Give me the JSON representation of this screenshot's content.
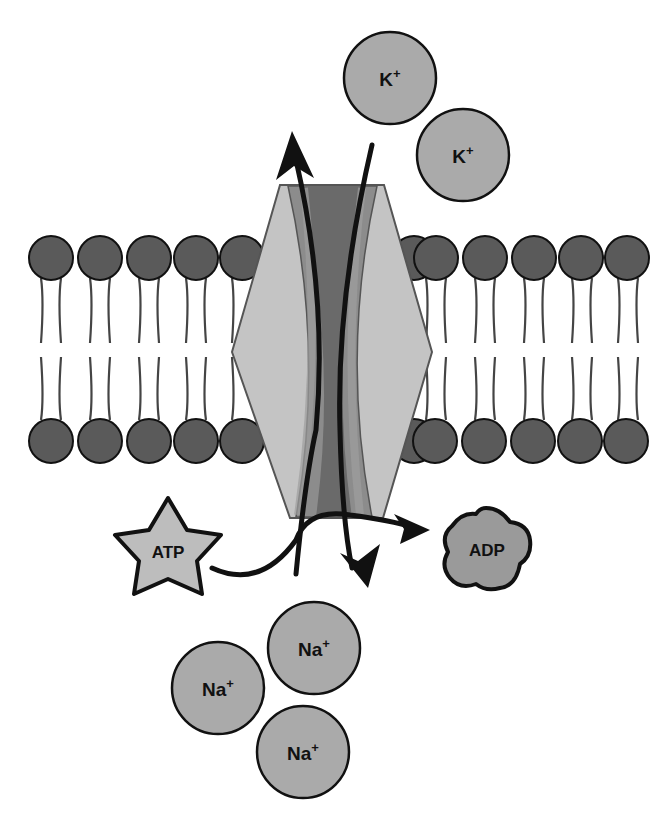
{
  "diagram": {
    "type": "sodium-potassium pump across lipid bilayer",
    "colors": {
      "background": "#ffffff",
      "phospholipid_head": "#5a5a5a",
      "ion_fill": "#aaaaaa",
      "protein_outer": "#c4c4c4",
      "protein_mid": "#8c8c8c",
      "protein_channel": "#6a6a6a",
      "atp_fill": "#bdbdbd",
      "adp_fill": "#9a9a9a",
      "stroke": "#111111"
    },
    "ions_outside": [
      {
        "label": "K",
        "charge": "+"
      },
      {
        "label": "K",
        "charge": "+"
      }
    ],
    "ions_inside": [
      {
        "label": "Na",
        "charge": "+"
      },
      {
        "label": "Na",
        "charge": "+"
      },
      {
        "label": "Na",
        "charge": "+"
      }
    ],
    "atp": {
      "label": "ATP"
    },
    "adp": {
      "label": "ADP"
    }
  }
}
